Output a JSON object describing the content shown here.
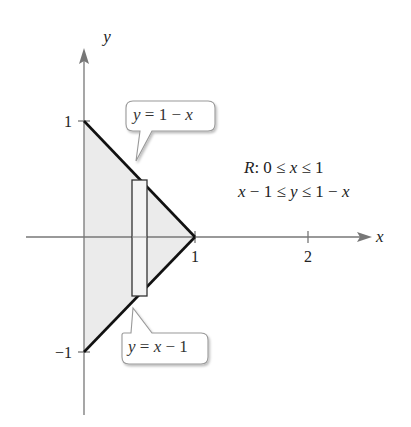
{
  "diagram": {
    "axes": {
      "x_label": "x",
      "y_label": "y",
      "x_ticks": [
        "1",
        "2"
      ],
      "y_ticks": [
        "1",
        "−1"
      ]
    },
    "region": {
      "name": "R",
      "line1": "R: 0 ≤ x ≤ 1",
      "line2": "x − 1 ≤ y ≤ 1 − x",
      "fill_color": "#ebebeb",
      "boundary_color": "#111111"
    },
    "callouts": {
      "upper": "y = 1 − x",
      "lower": "y = x − 1"
    },
    "representative_rectangle": {
      "description": "vertical strip"
    }
  }
}
